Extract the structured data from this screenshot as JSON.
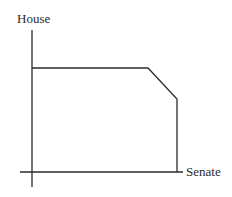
{
  "diagram": {
    "y_axis_label": "House",
    "x_axis_label": "Senate",
    "colors": {
      "line": "#2a2a2a",
      "background": "#ffffff"
    },
    "frontier": {
      "description": "Feasible set boundary: horizontal top, diagonal corner, vertical right side",
      "points": [
        [
          32,
          68
        ],
        [
          148,
          68
        ],
        [
          177,
          99
        ],
        [
          177,
          172
        ]
      ]
    }
  }
}
